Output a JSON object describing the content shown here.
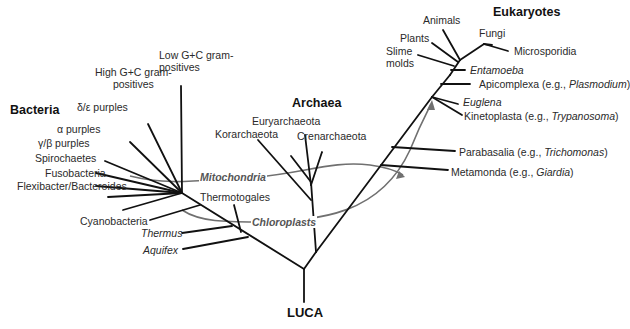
{
  "root": {
    "label": "LUCA"
  },
  "domains": {
    "bacteria": {
      "label": "Bacteria",
      "taxa": [
        {
          "label": "Low G+C gram-",
          "label2": "positives"
        },
        {
          "label": "High G+C gram-",
          "label2": "positives"
        },
        {
          "label": "δ/ε purples"
        },
        {
          "label": "α purples"
        },
        {
          "label": "γ/β purples"
        },
        {
          "label": "Spirochaetes"
        },
        {
          "label": "Fusobacteria"
        },
        {
          "label": "Flexibacter/Bacteroides"
        },
        {
          "label": "Cyanobacteria"
        },
        {
          "label": "Thermotogales"
        },
        {
          "label": "Thermus"
        },
        {
          "label": "Aquifex"
        }
      ]
    },
    "archaea": {
      "label": "Archaea",
      "taxa": [
        {
          "label": "Euryarchaeota"
        },
        {
          "label": "Korarchaeota"
        },
        {
          "label": "Crenarchaeota"
        }
      ]
    },
    "eukaryotes": {
      "label": "Eukaryotes",
      "taxa": [
        {
          "label": "Animals"
        },
        {
          "label": "Fungi"
        },
        {
          "label": "Plants"
        },
        {
          "label": "Microsporidia"
        },
        {
          "label": "Slime",
          "label2": "molds"
        },
        {
          "label": "Entamoeba"
        },
        {
          "label": "Apicomplexa (e.g., ",
          "example": "Plasmodium",
          "suffix": ")"
        },
        {
          "label": "Euglena"
        },
        {
          "label": "Kinetoplasta (e.g., ",
          "example": "Trypanosoma",
          "suffix": ")"
        },
        {
          "label": "Parabasalia (e.g., ",
          "example": "Trichomonas",
          "suffix": ")"
        },
        {
          "label": "Metamonda (e.g., ",
          "example": "Giardia",
          "suffix": ")"
        }
      ]
    }
  },
  "endosymbioses": [
    {
      "label": "Mitochondria"
    },
    {
      "label": "Chloroplasts"
    }
  ],
  "colors": {
    "branch": "#111111",
    "arrow": "#707070",
    "text": "#2a2a2a"
  }
}
